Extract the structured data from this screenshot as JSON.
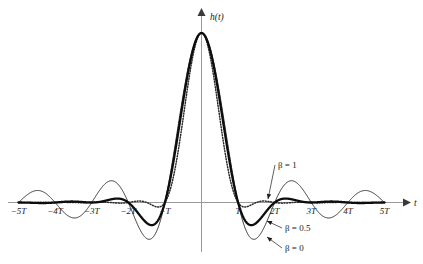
{
  "figure": {
    "background_color": "#ffffff",
    "width": 423,
    "height": 264
  },
  "axes": {
    "y_axis_label": "h(t)",
    "x_axis_label": "t",
    "x_tick_labels": [
      "−5T",
      "−4T",
      "−3T",
      "−2T",
      "−T",
      "T",
      "2T",
      "3T",
      "4T",
      "5T"
    ],
    "x_tick_values": [
      -5,
      -4,
      -3,
      -2,
      -1,
      1,
      2,
      3,
      4,
      5
    ],
    "axis_color": "#9a9a9a",
    "grid": false,
    "y_ticks_shown": false
  },
  "annotations": [
    {
      "id": "beta1",
      "text": "β = 1",
      "beta": 1,
      "label_x": 278,
      "label_y": 168,
      "point_x": 268,
      "point_y": 199
    },
    {
      "id": "beta05",
      "text": "β = 0.5",
      "beta": 0.5,
      "label_x": 285,
      "label_y": 231,
      "point_x": 267,
      "point_y": 221
    },
    {
      "id": "beta0",
      "text": "β = 0",
      "beta": 0,
      "label_x": 285,
      "label_y": 251,
      "point_x": 267,
      "point_y": 237
    }
  ],
  "chart_data": {
    "type": "line",
    "title": "",
    "subtitle": "",
    "xlabel": "t",
    "ylabel": "h(t)",
    "xlim": [
      -5.3,
      5.3
    ],
    "ylim": [
      -0.28,
      1.05
    ],
    "grid": false,
    "legend_position": "inline-annotations",
    "x_unit": "T",
    "formula": "h(t) = sinc(t/T) * cos(pi*beta*t/T) / (1 - (2*beta*t/T)^2)",
    "series": [
      {
        "name": "β = 0",
        "beta": 0,
        "style": "solid-thin",
        "color": "#1a1a1a",
        "linewidth": 0.9,
        "x": [
          -5,
          -4.5,
          -4,
          -3.5,
          -3,
          -2.5,
          -2,
          -1.5,
          -1,
          -0.5,
          0,
          0.5,
          1,
          1.5,
          2,
          2.5,
          3,
          3.5,
          4,
          4.5,
          5
        ],
        "values": [
          0,
          0.0707,
          0,
          -0.0909,
          0,
          0.1273,
          0,
          -0.2122,
          0,
          0.6366,
          1,
          0.6366,
          0,
          -0.2122,
          0,
          0.1273,
          0,
          -0.0909,
          0,
          0.0707,
          0
        ]
      },
      {
        "name": "β = 0.5",
        "beta": 0.5,
        "style": "solid-thick",
        "color": "#0d0d0d",
        "linewidth": 2.3,
        "x": [
          -5,
          -4.5,
          -4,
          -3.5,
          -3,
          -2.5,
          -2,
          -1.5,
          -1,
          -0.5,
          0,
          0.5,
          1,
          1.5,
          2,
          2.5,
          3,
          3.5,
          4,
          4.5,
          5
        ],
        "values": [
          0,
          -0.0045,
          0,
          0.0093,
          0,
          -0.0255,
          0,
          0.1061,
          0,
          0.6366,
          1,
          0.6366,
          0,
          0.1061,
          0,
          -0.0255,
          0,
          0.0093,
          0,
          -0.0045,
          0
        ]
      },
      {
        "name": "β = 1",
        "beta": 1,
        "style": "dotted",
        "color": "#2a2a2a",
        "linewidth": 1.5,
        "x": [
          -5,
          -4.5,
          -4,
          -3.5,
          -3,
          -2.5,
          -2,
          -1.5,
          -1,
          -0.5,
          0,
          0.5,
          1,
          1.5,
          2,
          2.5,
          3,
          3.5,
          4,
          4.5,
          5
        ],
        "values": [
          0,
          0.0009,
          0,
          -0.0014,
          0,
          0.0027,
          0,
          -0.0074,
          0,
          0.5,
          1,
          0.5,
          0,
          -0.0074,
          0,
          0.0027,
          0,
          -0.0014,
          0,
          0.0009,
          0
        ]
      }
    ]
  }
}
